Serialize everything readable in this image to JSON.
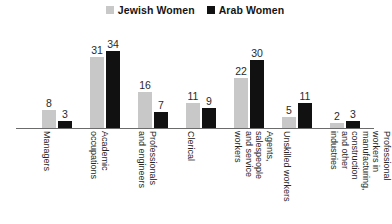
{
  "chart_data": {
    "type": "bar",
    "title": "",
    "subtitle": "",
    "xlabel": "",
    "ylabel": "",
    "ylim": [
      0,
      36
    ],
    "grid": false,
    "legend_position": "top-center",
    "data_labels": true,
    "categories": [
      "Managers",
      "Academic occupations",
      "Professionals and engineers",
      "Clerical",
      "Agents, salespeople and service workers",
      "Unskilled workers",
      "Professional workers in manufacturing, construction and other industries"
    ],
    "category_lines": [
      [
        "Managers"
      ],
      [
        "Academic",
        "occupations"
      ],
      [
        "Professionals",
        "and engineers"
      ],
      [
        "Clerical"
      ],
      [
        "Agents,",
        "salespeople",
        "and service",
        "workers"
      ],
      [
        "Unskilled workers"
      ],
      [
        "Professional",
        "workers in",
        "manufacturing,",
        "construction",
        "and other",
        "industries"
      ]
    ],
    "series": [
      {
        "name": "Jewish Women",
        "color": "#c8c8c8",
        "values": [
          8,
          31,
          16,
          11,
          22,
          5,
          2
        ]
      },
      {
        "name": "Arab Women",
        "color": "#111111",
        "values": [
          3,
          34,
          7,
          9,
          30,
          11,
          3
        ]
      }
    ]
  },
  "legend": {
    "entries": [
      {
        "label": "Jewish Women",
        "color": "#c8c8c8"
      },
      {
        "label": "Arab Women",
        "color": "#111111"
      }
    ]
  },
  "axis": {
    "baseline_color": "#6b6b6b"
  }
}
